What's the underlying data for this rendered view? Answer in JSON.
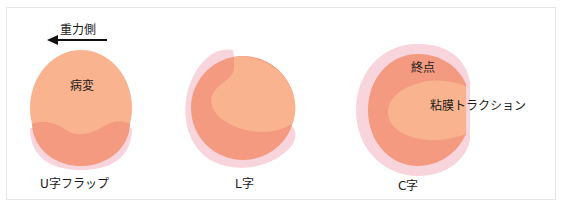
{
  "figure": {
    "gravity_label": "重力側",
    "lesion_label": "病変",
    "endpoint_label": "終点",
    "traction_label": "粘膜トラクション",
    "panels": [
      {
        "caption": "U字フラップ"
      },
      {
        "caption": "L字"
      },
      {
        "caption": "C字"
      }
    ]
  },
  "colors": {
    "lesion": "#f9b48f",
    "incision": "#f39a80",
    "halo": "#f7cdd6",
    "text": "#1a1a1a",
    "frame_border": "#e4e6e8"
  }
}
